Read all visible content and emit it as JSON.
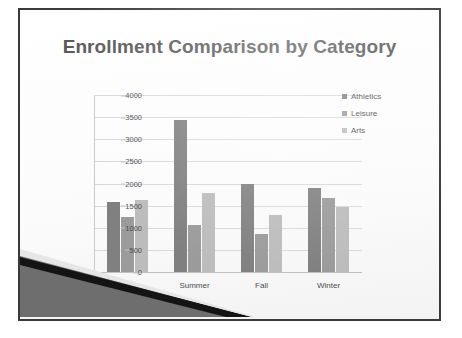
{
  "slide": {
    "title": "Enrollment Comparison by Category"
  },
  "chart_data": {
    "type": "bar",
    "title": "Enrollment Comparison by Category",
    "xlabel": "",
    "ylabel": "",
    "ylim": [
      0,
      4000
    ],
    "ytick_step": 500,
    "yticks": [
      "4000",
      "3500",
      "3000",
      "2500",
      "2000",
      "1500",
      "1000",
      "500",
      "0"
    ],
    "grid": true,
    "legend_position": "right",
    "categories": [
      "Spring",
      "Summer",
      "Fall",
      "Winter"
    ],
    "series": [
      {
        "name": "Athletics",
        "color": "#808080",
        "values": [
          1590,
          3430,
          1990,
          1890
        ]
      },
      {
        "name": "Leisure",
        "color": "#9b9b9b",
        "values": [
          1250,
          1060,
          850,
          1680
        ]
      },
      {
        "name": "Arts",
        "color": "#bcbcbc",
        "values": [
          1630,
          1780,
          1290,
          1460
        ]
      }
    ]
  },
  "decoration": {
    "wedge_fill": "#6e6e6e",
    "wedge_edge": "#141414",
    "frame_color": "#3a3a3a"
  }
}
